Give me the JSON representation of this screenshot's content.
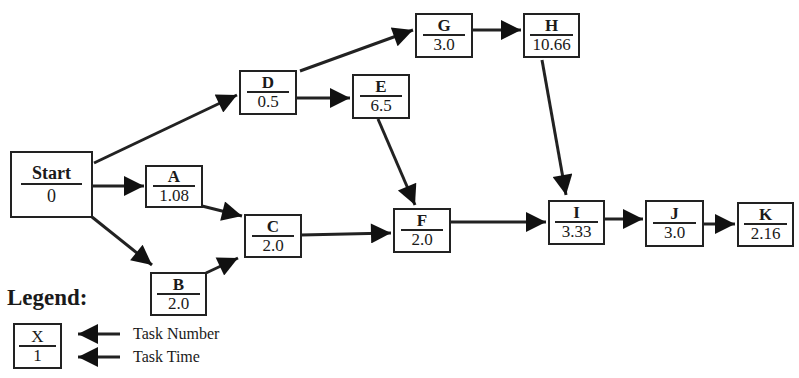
{
  "diagram": {
    "type": "activity-on-node precedence network",
    "nodes": [
      {
        "id": "start",
        "task": "Start",
        "time": "0"
      },
      {
        "id": "a",
        "task": "A",
        "time": "1.08"
      },
      {
        "id": "b",
        "task": "B",
        "time": "2.0"
      },
      {
        "id": "c",
        "task": "C",
        "time": "2.0"
      },
      {
        "id": "d",
        "task": "D",
        "time": "0.5"
      },
      {
        "id": "e",
        "task": "E",
        "time": "6.5"
      },
      {
        "id": "f",
        "task": "F",
        "time": "2.0"
      },
      {
        "id": "g",
        "task": "G",
        "time": "3.0"
      },
      {
        "id": "h",
        "task": "H",
        "time": "10.66"
      },
      {
        "id": "i",
        "task": "I",
        "time": "3.33"
      },
      {
        "id": "j",
        "task": "J",
        "time": "3.0"
      },
      {
        "id": "k",
        "task": "K",
        "time": "2.16"
      }
    ],
    "edges": [
      {
        "from": "Start",
        "to": "A"
      },
      {
        "from": "Start",
        "to": "B"
      },
      {
        "from": "Start",
        "to": "D"
      },
      {
        "from": "A",
        "to": "C"
      },
      {
        "from": "B",
        "to": "C"
      },
      {
        "from": "D",
        "to": "E"
      },
      {
        "from": "D",
        "to": "G"
      },
      {
        "from": "G",
        "to": "H"
      },
      {
        "from": "E",
        "to": "F"
      },
      {
        "from": "C",
        "to": "F"
      },
      {
        "from": "F",
        "to": "I"
      },
      {
        "from": "H",
        "to": "I"
      },
      {
        "from": "I",
        "to": "J"
      },
      {
        "from": "J",
        "to": "K"
      }
    ]
  },
  "legend": {
    "title": "Legend:",
    "sample_task": "X",
    "sample_time": "1",
    "task_number_label": "Task Number",
    "task_time_label": "Task Time"
  },
  "colors": {
    "line": "#222222",
    "background": "#ffffff"
  }
}
